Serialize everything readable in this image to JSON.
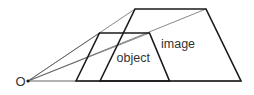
{
  "diagram": {
    "title": "",
    "origin_label": "O",
    "object_label": "object",
    "image_label": "image",
    "colors": {
      "line": "#1a1a1a",
      "thin_line": "#555555",
      "text": "#333333",
      "background": "#ffffff"
    }
  }
}
